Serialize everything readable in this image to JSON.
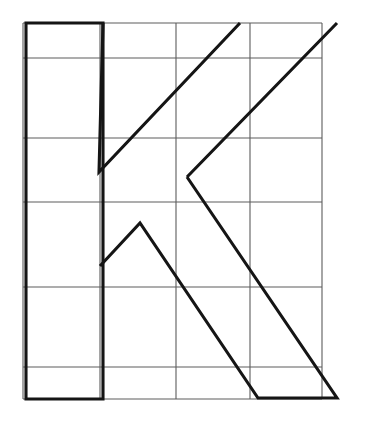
{
  "figure": {
    "glyph_character": "K",
    "background_color": "#ffffff",
    "grid_color": "#5c5c5c",
    "outline_color": "#151515",
    "grid_stroke_width": 1.1,
    "outline_stroke_width": 3.1,
    "canvas": {
      "width": 370,
      "height": 421
    }
  },
  "grid": {
    "vertical_x": [
      23,
      100,
      176,
      250,
      322
    ],
    "horizontal_y": [
      23,
      58,
      138,
      202,
      287,
      367,
      399
    ],
    "left": 23,
    "right": 322,
    "top": 23,
    "bottom": 399,
    "columns": 4,
    "rows": 6
  },
  "glyph": {
    "stem": {
      "name": "vertical-stem",
      "left_x": 26,
      "right_x": 103,
      "top_y": 23,
      "bottom_y": 399,
      "path": "M 26 23 L 103 23 L 103 399 L 26 399 Z"
    },
    "upper_arm": {
      "name": "upper-diagonal-arm",
      "points": [
        [
          103,
          23
        ],
        [
          240,
          23
        ],
        [
          337,
          23
        ],
        [
          187,
          177
        ],
        [
          99,
          172
        ]
      ],
      "path": "M 240 23 L 99 172 L 103 23 M 337 23 L 187 177"
    },
    "lower_leg": {
      "name": "lower-diagonal-leg",
      "points": [
        [
          187,
          177
        ],
        [
          337,
          398
        ],
        [
          258,
          398
        ],
        [
          140,
          223
        ],
        [
          100,
          266
        ],
        [
          100,
          399
        ]
      ],
      "path": "M 187 177 L 337 398 L 258 398 L 140 223 L 100 266"
    },
    "vertices": {
      "arm_apex_top": [
        240,
        23
      ],
      "arm_tip_top_right": [
        337,
        23
      ],
      "arm_inner_notch": [
        99,
        172
      ],
      "junction_v": [
        187,
        177
      ],
      "leg_peak": [
        140,
        223
      ],
      "leg_stem_junction": [
        100,
        266
      ],
      "leg_tip_bottom_right": [
        337,
        398
      ],
      "leg_inner_bottom": [
        258,
        398
      ]
    },
    "combined_path": "M 26 23 L 103 23 L 240 23 L 337 23 L 187 177 L 337 398 L 258 398 L 140 223 L 100 266 L 100 399 L 26 399 Z M 103 23 L 99 172 L 187 177"
  }
}
